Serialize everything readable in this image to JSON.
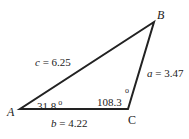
{
  "diagram": {
    "type": "triangle",
    "vertices": {
      "A": {
        "label": "A"
      },
      "B": {
        "label": "B"
      },
      "C": {
        "label": "C"
      }
    },
    "sides": {
      "a": {
        "var": "a",
        "text": " = 3.47"
      },
      "b": {
        "var": "b",
        "text": " = 4.22"
      },
      "c": {
        "var": "c",
        "text": " = 6.25"
      }
    },
    "angles": {
      "A": {
        "value": "31.8",
        "unit": "o"
      },
      "C": {
        "value": "108.3",
        "unit": "o"
      }
    },
    "colors": {
      "stroke": "#222222",
      "background": "#ffffff"
    }
  }
}
